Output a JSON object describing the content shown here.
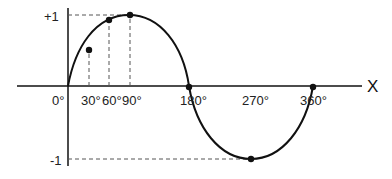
{
  "diagram": {
    "type": "sine-wave",
    "axis_label_x": "X",
    "y_labels": {
      "top": "+1",
      "bottom": "-1"
    },
    "x_ticks": [
      {
        "label": "0°",
        "deg": 0
      },
      {
        "label": "30°",
        "deg": 30
      },
      {
        "label": "60°",
        "deg": 60
      },
      {
        "label": "90°",
        "deg": 90
      },
      {
        "label": "180°",
        "deg": 180
      },
      {
        "label": "270°",
        "deg": 270
      },
      {
        "label": "360°",
        "deg": 360
      }
    ],
    "points": [
      {
        "deg": 30,
        "value": 0.5
      },
      {
        "deg": 60,
        "value": 0.866
      },
      {
        "deg": 90,
        "value": 1
      },
      {
        "deg": 180,
        "value": 0
      },
      {
        "deg": 270,
        "value": -1
      },
      {
        "deg": 360,
        "value": 0
      }
    ],
    "colors": {
      "curve": "#111111",
      "axis": "#111111",
      "dashed": "#555555"
    }
  }
}
